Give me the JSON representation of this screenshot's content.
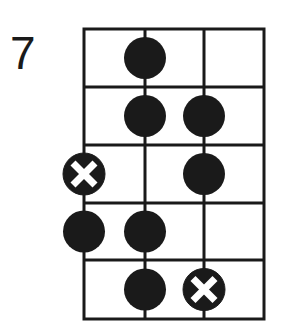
{
  "diagram": {
    "type": "fretboard-scale-pattern",
    "start_fret_label": "7",
    "strings": 4,
    "frets": 5,
    "colors": {
      "line": "#1a1a1a",
      "dot": "#1a1a1a",
      "root_mark": "#ffffff",
      "background": "#ffffff"
    },
    "notes": [
      {
        "fret": 1,
        "string": 2,
        "root": false
      },
      {
        "fret": 2,
        "string": 2,
        "root": false
      },
      {
        "fret": 2,
        "string": 3,
        "root": false
      },
      {
        "fret": 3,
        "string": 1,
        "root": true
      },
      {
        "fret": 3,
        "string": 3,
        "root": false
      },
      {
        "fret": 4,
        "string": 1,
        "root": false
      },
      {
        "fret": 4,
        "string": 2,
        "root": false
      },
      {
        "fret": 5,
        "string": 2,
        "root": false
      },
      {
        "fret": 5,
        "string": 3,
        "root": true
      }
    ]
  }
}
